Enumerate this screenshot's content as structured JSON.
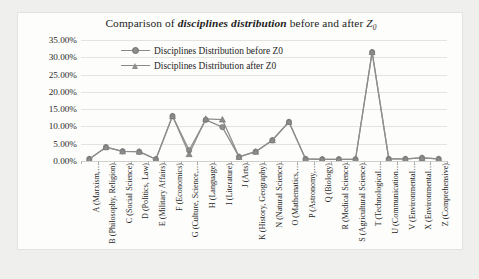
{
  "figure": {
    "caption": ""
  },
  "chart_data": {
    "type": "line",
    "title_parts": {
      "prefix": "Comparison of ",
      "emphasis": "disciplines distribution",
      "middle": " before and after ",
      "z_symbol": "Z",
      "z_subscript": "0"
    },
    "title": "Comparison of disciplines distribution before and after Z0",
    "xlabel": "",
    "ylabel": "",
    "ylim": [
      0,
      35
    ],
    "ytick_labels": [
      "0.00%",
      "5.00%",
      "10.00%",
      "15.00%",
      "20.00%",
      "25.00%",
      "30.00%",
      "35.00%"
    ],
    "ytick_values": [
      0,
      5,
      10,
      15,
      20,
      25,
      30,
      35
    ],
    "grid": true,
    "legend_position": "top-left-inside",
    "categories": [
      "A (Marxism,…",
      "B (Philosophy, Religion)",
      "C (Social Science)",
      "D (Politics, Law)",
      "E (Military Affairs)",
      "F (Economics)",
      "G (Culture, Science,…",
      "H (Language)",
      "I (Literature)",
      "J (Arts)",
      "K (History, Geography)",
      "N (Natural Science)",
      "O (Mathematics,…",
      "P (Astronomy,…",
      "Q (Biology)",
      "R (Medical Science)",
      "S (Agricultural Science)",
      "T (Technological…",
      "U (Communication…",
      "V (Environmental…",
      "X (Environmental…",
      "Z (Comprehensive)"
    ],
    "series": [
      {
        "name": "Disciplines Distribution before Z0",
        "marker": "circle",
        "color": "#8d8d8d",
        "values": [
          0.6,
          4.0,
          2.8,
          2.7,
          0.5,
          13.0,
          3.1,
          11.9,
          9.8,
          1.2,
          2.7,
          6.0,
          11.3,
          0.6,
          0.5,
          0.5,
          0.5,
          31.5,
          0.6,
          0.6,
          0.9,
          0.6
        ]
      },
      {
        "name": "Disciplines Distribution after Z0",
        "marker": "triangle",
        "color": "#8d8d8d",
        "values": [
          0.6,
          4.0,
          2.8,
          2.7,
          0.5,
          13.0,
          2.0,
          12.2,
          12.0,
          1.2,
          2.7,
          6.0,
          11.3,
          0.6,
          0.5,
          0.5,
          0.5,
          31.5,
          0.6,
          0.6,
          0.9,
          0.6
        ]
      }
    ]
  },
  "legend": {
    "items": [
      {
        "label": "Disciplines Distribution before Z0",
        "marker": "circle-marker"
      },
      {
        "label": "Disciplines Distribution after Z0",
        "marker": "triangle-marker"
      }
    ]
  }
}
